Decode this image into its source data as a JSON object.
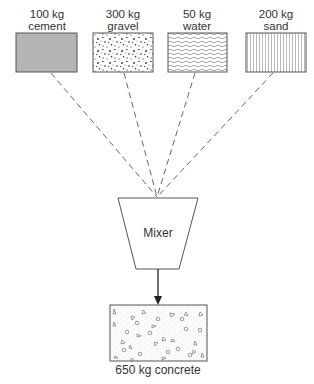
{
  "diagram": {
    "inputs": [
      {
        "amount": "100 kg",
        "material": "cement",
        "pattern": "solid-gray",
        "color": "#b4b4b4"
      },
      {
        "amount": "300 kg",
        "material": "gravel",
        "pattern": "speckled"
      },
      {
        "amount": "50 kg",
        "material": "water",
        "pattern": "wavy-lines"
      },
      {
        "amount": "200 kg",
        "material": "sand",
        "pattern": "vertical-lines"
      }
    ],
    "mixer": {
      "label": "Mixer"
    },
    "output": {
      "label": "650 kg concrete",
      "pattern": "dots-and-shapes"
    },
    "colors": {
      "stroke": "#555555",
      "text": "#333333",
      "dash": "#666666"
    }
  }
}
